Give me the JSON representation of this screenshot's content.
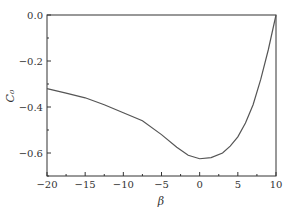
{
  "chart_data": {
    "type": "line",
    "title": "",
    "xlabel": "β",
    "ylabel": "C₀",
    "xlim": [
      -20,
      10
    ],
    "ylim": [
      -0.7,
      0.0
    ],
    "xticks": [
      -20,
      -15,
      -10,
      -5,
      0,
      5,
      10
    ],
    "xtick_labels": [
      "−20",
      "−15",
      "−10",
      "−5",
      "0",
      "5",
      "10"
    ],
    "yticks": [
      0.0,
      -0.2,
      -0.4,
      -0.6
    ],
    "ytick_labels": [
      "0.0",
      "−0.2",
      "−0.4",
      "−0.6"
    ],
    "grid": false,
    "legend": null,
    "series": [
      {
        "name": "C0",
        "color": "#555555",
        "x": [
          -20,
          -17.5,
          -15,
          -12.5,
          -10,
          -7.5,
          -5,
          -3,
          -1.5,
          0,
          1.5,
          3,
          4,
          5,
          6,
          7,
          8,
          9,
          10
        ],
        "y": [
          -0.32,
          -0.34,
          -0.36,
          -0.39,
          -0.425,
          -0.46,
          -0.52,
          -0.575,
          -0.61,
          -0.625,
          -0.62,
          -0.6,
          -0.57,
          -0.53,
          -0.47,
          -0.39,
          -0.28,
          -0.15,
          0.0
        ]
      }
    ]
  }
}
